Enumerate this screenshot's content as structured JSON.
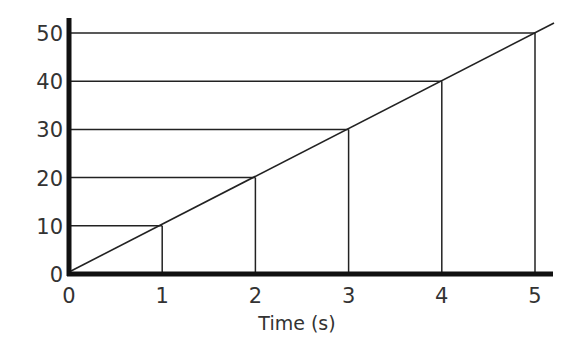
{
  "chart_data": {
    "type": "line",
    "title": "",
    "xlabel": "Time (s)",
    "ylabel": "",
    "x": [
      0,
      1,
      2,
      3,
      4,
      5
    ],
    "series": [
      {
        "name": "line",
        "values": [
          0,
          10,
          20,
          30,
          40,
          50
        ]
      }
    ],
    "x_ticks": [
      "0",
      "1",
      "2",
      "3",
      "4",
      "5"
    ],
    "y_ticks": [
      "0",
      "10",
      "20",
      "30",
      "40",
      "50"
    ],
    "xlim": [
      0,
      5.2
    ],
    "ylim": [
      0,
      52
    ],
    "grid": "drop lines from each data point to both axes",
    "legend": "none"
  }
}
